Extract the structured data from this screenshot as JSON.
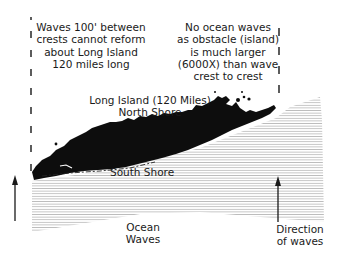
{
  "diagram": {
    "left_note": [
      "Waves 100' between",
      "crests cannot reform",
      "about Long Island",
      "120 miles long"
    ],
    "right_note": [
      "No ocean waves",
      "as obstacle (island)",
      "is much larger",
      "(6000X) than wave",
      "crest to crest"
    ],
    "island_title": [
      "Long Island (120 Miles)",
      "North Shore"
    ],
    "south_shore": "South Shore",
    "ocean_label": [
      "Ocean",
      "Waves"
    ],
    "direction_label": [
      "Direction",
      "of waves"
    ],
    "icons": {
      "left_arrow": "arrow-up-icon",
      "right_arrow": "arrow-up-icon"
    },
    "colors": {
      "island": "#0d0d0d",
      "wave_lines": "#bdbdbd",
      "text": "#1a1a1a",
      "dashes": "#333333"
    }
  }
}
